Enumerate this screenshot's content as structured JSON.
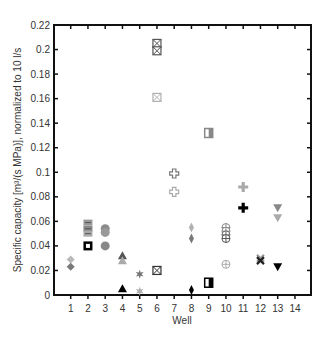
{
  "chart_data": {
    "type": "scatter",
    "title": "",
    "xlabel": "Well",
    "ylabel": "Specific capacity [m³/(s MPa)], normalized to 10 l/s",
    "xlim": [
      0.3,
      14.8
    ],
    "ylim": [
      0,
      0.22
    ],
    "x_ticks": [
      1,
      2,
      3,
      4,
      5,
      6,
      7,
      8,
      9,
      10,
      11,
      12,
      13,
      14
    ],
    "y_ticks": [
      0,
      0.02,
      0.04,
      0.06,
      0.08,
      0.1,
      0.12,
      0.14,
      0.16,
      0.18,
      0.2,
      0.22
    ],
    "y_tick_labels": [
      "0",
      "0.02",
      "0.04",
      "0.06",
      "0.08",
      "0.1",
      "0.12",
      "0.14",
      "0.16",
      "0.18",
      "0.2",
      "0.22"
    ],
    "grid": false,
    "legend": null,
    "series": [
      {
        "name": "Well 1",
        "marker": "diamond",
        "points": [
          {
            "x": 1,
            "y": 0.029,
            "color": "#b8b8b8"
          },
          {
            "x": 1,
            "y": 0.023,
            "color": "#7a7a7a"
          }
        ]
      },
      {
        "name": "Well 2",
        "marker": "square-striped",
        "points": [
          {
            "x": 2,
            "y": 0.059,
            "color": "#999999"
          },
          {
            "x": 2,
            "y": 0.054,
            "color": "#888888"
          },
          {
            "x": 2,
            "y": 0.05,
            "color": "#aaaaaa"
          },
          {
            "x": 2,
            "y": 0.04,
            "color": "#000000",
            "style": "framed"
          }
        ]
      },
      {
        "name": "Well 3",
        "marker": "circle",
        "points": [
          {
            "x": 3,
            "y": 0.054,
            "color": "#8a8a8a"
          },
          {
            "x": 3,
            "y": 0.051,
            "color": "#999999"
          },
          {
            "x": 3,
            "y": 0.04,
            "color": "#888888"
          }
        ]
      },
      {
        "name": "Well 4",
        "marker": "triangle-up",
        "points": [
          {
            "x": 4,
            "y": 0.032,
            "color": "#555555"
          },
          {
            "x": 4,
            "y": 0.028,
            "color": "#aaaaaa"
          },
          {
            "x": 4,
            "y": 0.005,
            "color": "#000000"
          }
        ]
      },
      {
        "name": "Well 5",
        "marker": "star",
        "points": [
          {
            "x": 5,
            "y": 0.017,
            "color": "#777777"
          },
          {
            "x": 5,
            "y": 0.003,
            "color": "#b0b0b0"
          }
        ]
      },
      {
        "name": "Well 6",
        "marker": "square-x",
        "points": [
          {
            "x": 6,
            "y": 0.205,
            "color": "#555555"
          },
          {
            "x": 6,
            "y": 0.199,
            "color": "#555555"
          },
          {
            "x": 6,
            "y": 0.161,
            "color": "#b0b0b0"
          },
          {
            "x": 6,
            "y": 0.02,
            "color": "#333333"
          }
        ]
      },
      {
        "name": "Well 7",
        "marker": "open-cross",
        "points": [
          {
            "x": 7,
            "y": 0.099,
            "color": "#777777"
          },
          {
            "x": 7,
            "y": 0.084,
            "color": "#aaaaaa"
          }
        ]
      },
      {
        "name": "Well 8",
        "marker": "thin-diamond",
        "points": [
          {
            "x": 8,
            "y": 0.055,
            "color": "#b0b0b0"
          },
          {
            "x": 8,
            "y": 0.046,
            "color": "#777777"
          },
          {
            "x": 8,
            "y": 0.004,
            "color": "#000000"
          }
        ]
      },
      {
        "name": "Well 9",
        "marker": "half-square",
        "points": [
          {
            "x": 9,
            "y": 0.132,
            "color": "#888888"
          },
          {
            "x": 9,
            "y": 0.01,
            "color": "#000000"
          }
        ]
      },
      {
        "name": "Well 10",
        "marker": "circle-plus",
        "points": [
          {
            "x": 10,
            "y": 0.055,
            "color": "#888888"
          },
          {
            "x": 10,
            "y": 0.052,
            "color": "#888888"
          },
          {
            "x": 10,
            "y": 0.049,
            "color": "#666666"
          },
          {
            "x": 10,
            "y": 0.046,
            "color": "#555555"
          },
          {
            "x": 10,
            "y": 0.025,
            "color": "#aaaaaa"
          }
        ]
      },
      {
        "name": "Well 11",
        "marker": "cross",
        "points": [
          {
            "x": 11,
            "y": 0.088,
            "color": "#aaaaaa"
          },
          {
            "x": 11,
            "y": 0.071,
            "color": "#000000"
          }
        ]
      },
      {
        "name": "Well 12",
        "marker": "x",
        "points": [
          {
            "x": 12,
            "y": 0.03,
            "color": "#999999"
          },
          {
            "x": 12,
            "y": 0.028,
            "color": "#222222"
          }
        ]
      },
      {
        "name": "Well 13",
        "marker": "triangle-down",
        "points": [
          {
            "x": 13,
            "y": 0.071,
            "color": "#888888"
          },
          {
            "x": 13,
            "y": 0.063,
            "color": "#aaaaaa"
          },
          {
            "x": 13,
            "y": 0.023,
            "color": "#000000"
          }
        ]
      }
    ]
  }
}
